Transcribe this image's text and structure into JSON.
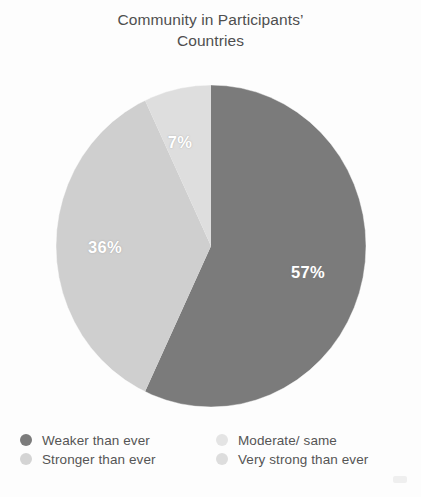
{
  "figure": {
    "title": "Community in Participants’\nCountries",
    "background_color": "#ffffff"
  },
  "chart_data": {
    "type": "pie",
    "title": "Community in Participants’ Countries",
    "xlabel": "",
    "ylabel": "",
    "grid": false,
    "legend_position": "bottom",
    "start_angle_deg": 0,
    "direction": "clockwise",
    "labels": [
      "Weaker than ever",
      "Moderate/ same",
      "Stronger than ever",
      "Very strong than ever"
    ],
    "slices": [
      {
        "label": "Weaker than ever",
        "value": 57,
        "display": "57%",
        "color": "#7b7b7b"
      },
      {
        "label": "Moderate/ same",
        "value": 36,
        "display": "36%",
        "color": "#cfcfcf"
      },
      {
        "label": "Stronger than ever",
        "value": 7,
        "display": "7%",
        "color": "#dedede"
      },
      {
        "label": "Very strong than ever",
        "value": 0,
        "display": "",
        "color": "#e7e7e7"
      }
    ],
    "values": [
      57,
      36,
      7,
      0
    ],
    "categories": [
      "Weaker than ever",
      "Moderate/ same",
      "Stronger than ever",
      "Very strong than ever"
    ],
    "value_labels": [
      "57%",
      "36%",
      "7%"
    ],
    "units": "percent",
    "total": 100
  },
  "labels": {
    "slice_0": "57%",
    "slice_1": "36%",
    "slice_2": "7%"
  },
  "legend": {
    "items": [
      {
        "label": "Weaker than ever",
        "color": "#7b7b7b",
        "column": "left",
        "row": 0
      },
      {
        "label": "Stronger than ever",
        "color": "#d4d4d4",
        "column": "left",
        "row": 1
      },
      {
        "label": "Moderate/ same",
        "color": "#e4e4e4",
        "column": "right",
        "row": 0
      },
      {
        "label": "Very strong than ever",
        "color": "#dddddd",
        "column": "right",
        "row": 1
      }
    ]
  },
  "colors": {
    "slice_weaker": "#7b7b7b",
    "slice_moderate": "#cfcfcf",
    "slice_stronger": "#dedede",
    "slice_very_strong": "#e7e7e7",
    "text": "#555555",
    "title": "#4f4f4f",
    "label_text": "#ffffff"
  }
}
